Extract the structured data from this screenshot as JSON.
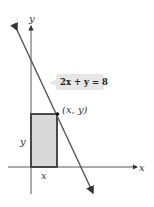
{
  "diagram": {
    "equation_label": "2x + y = 8",
    "point_label": "(x, y)",
    "x_axis_label": "x",
    "y_axis_label": "y",
    "rect_width_label": "x",
    "rect_height_label": "y",
    "colors": {
      "rect_fill": "#d9d9d9",
      "stroke": "#333333",
      "line": "#555555",
      "bubble": "#e6e6e6"
    }
  }
}
